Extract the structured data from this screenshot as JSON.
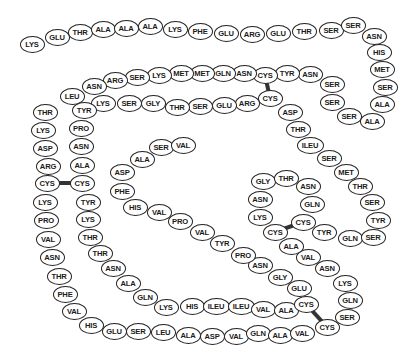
{
  "diagram": {
    "colors": {
      "outline": "#222222",
      "fill": "#ffffff",
      "text": "#1a1a1a",
      "bond": "#333333"
    },
    "residues": [
      {
        "label": "LYS",
        "x": 32,
        "y": 44
      },
      {
        "label": "GLU",
        "x": 57,
        "y": 37
      },
      {
        "label": "THR",
        "x": 80,
        "y": 32
      },
      {
        "label": "ALA",
        "x": 103,
        "y": 29
      },
      {
        "label": "ALA",
        "x": 126,
        "y": 28
      },
      {
        "label": "ALA",
        "x": 150,
        "y": 26
      },
      {
        "label": "LYS",
        "x": 175,
        "y": 29
      },
      {
        "label": "PHE",
        "x": 200,
        "y": 31
      },
      {
        "label": "GLU",
        "x": 226,
        "y": 33
      },
      {
        "label": "ARG",
        "x": 252,
        "y": 34
      },
      {
        "label": "GLU",
        "x": 278,
        "y": 33
      },
      {
        "label": "THR",
        "x": 304,
        "y": 31
      },
      {
        "label": "SER",
        "x": 331,
        "y": 30
      },
      {
        "label": "SER",
        "x": 353,
        "y": 25
      },
      {
        "label": "ASN",
        "x": 374,
        "y": 36
      },
      {
        "label": "HIS",
        "x": 379,
        "y": 52
      },
      {
        "label": "MET",
        "x": 382,
        "y": 69
      },
      {
        "label": "SER",
        "x": 385,
        "y": 87
      },
      {
        "label": "ALA",
        "x": 382,
        "y": 104
      },
      {
        "label": "ALA",
        "x": 372,
        "y": 121
      },
      {
        "label": "SER",
        "x": 349,
        "y": 116
      },
      {
        "label": "SER",
        "x": 332,
        "y": 102
      },
      {
        "label": "SER",
        "x": 332,
        "y": 84
      },
      {
        "label": "ASN",
        "x": 310,
        "y": 74
      },
      {
        "label": "TYR",
        "x": 287,
        "y": 73
      },
      {
        "label": "CYS",
        "x": 265,
        "y": 75
      },
      {
        "label": "ASN",
        "x": 244,
        "y": 73
      },
      {
        "label": "GLN",
        "x": 223,
        "y": 73
      },
      {
        "label": "MET",
        "x": 202,
        "y": 73
      },
      {
        "label": "MET",
        "x": 181,
        "y": 73
      },
      {
        "label": "LYS",
        "x": 159,
        "y": 75
      },
      {
        "label": "SER",
        "x": 137,
        "y": 77
      },
      {
        "label": "ARG",
        "x": 115,
        "y": 80
      },
      {
        "label": "ASN",
        "x": 94,
        "y": 86
      },
      {
        "label": "LEU",
        "x": 72,
        "y": 96
      },
      {
        "label": "THR",
        "x": 45,
        "y": 112
      },
      {
        "label": "LYS",
        "x": 43,
        "y": 130
      },
      {
        "label": "ASP",
        "x": 45,
        "y": 148
      },
      {
        "label": "ARG",
        "x": 48,
        "y": 166
      },
      {
        "label": "CYS",
        "x": 47,
        "y": 183
      },
      {
        "label": "LYS",
        "x": 45,
        "y": 202
      },
      {
        "label": "PRO",
        "x": 46,
        "y": 220
      },
      {
        "label": "VAL",
        "x": 48,
        "y": 239
      },
      {
        "label": "ASN",
        "x": 52,
        "y": 257
      },
      {
        "label": "THR",
        "x": 59,
        "y": 276
      },
      {
        "label": "PHE",
        "x": 65,
        "y": 294
      },
      {
        "label": "VAL",
        "x": 74,
        "y": 311
      },
      {
        "label": "HIS",
        "x": 91,
        "y": 325
      },
      {
        "label": "GLU",
        "x": 114,
        "y": 331
      },
      {
        "label": "SER",
        "x": 138,
        "y": 331
      },
      {
        "label": "LEU",
        "x": 163,
        "y": 332
      },
      {
        "label": "ALA",
        "x": 188,
        "y": 335
      },
      {
        "label": "ASP",
        "x": 212,
        "y": 336
      },
      {
        "label": "VAL",
        "x": 236,
        "y": 336
      },
      {
        "label": "GLN",
        "x": 258,
        "y": 333
      },
      {
        "label": "ALA",
        "x": 280,
        "y": 335
      },
      {
        "label": "VAL",
        "x": 302,
        "y": 333
      },
      {
        "label": "CYS",
        "x": 327,
        "y": 327
      },
      {
        "label": "SER",
        "x": 347,
        "y": 317
      },
      {
        "label": "GLN",
        "x": 350,
        "y": 300
      },
      {
        "label": "LYS",
        "x": 345,
        "y": 283
      },
      {
        "label": "ASN",
        "x": 327,
        "y": 268
      },
      {
        "label": "VAL",
        "x": 308,
        "y": 257
      },
      {
        "label": "ALA",
        "x": 291,
        "y": 246
      },
      {
        "label": "CYS",
        "x": 275,
        "y": 232
      },
      {
        "label": "LYS",
        "x": 260,
        "y": 217
      },
      {
        "label": "ASN",
        "x": 260,
        "y": 199
      },
      {
        "label": "GLY",
        "x": 263,
        "y": 181
      },
      {
        "label": "THR",
        "x": 286,
        "y": 178
      },
      {
        "label": "ASN",
        "x": 308,
        "y": 186
      },
      {
        "label": "GLN",
        "x": 312,
        "y": 204
      },
      {
        "label": "CYS",
        "x": 303,
        "y": 222
      },
      {
        "label": "TYR",
        "x": 324,
        "y": 232
      },
      {
        "label": "GLN",
        "x": 350,
        "y": 238
      },
      {
        "label": "SER",
        "x": 373,
        "y": 237
      },
      {
        "label": "TYR",
        "x": 378,
        "y": 220
      },
      {
        "label": "SER",
        "x": 372,
        "y": 202
      },
      {
        "label": "THR",
        "x": 360,
        "y": 186
      },
      {
        "label": "MET",
        "x": 346,
        "y": 172
      },
      {
        "label": "SER",
        "x": 329,
        "y": 158
      },
      {
        "label": "ILEU",
        "x": 310,
        "y": 145
      },
      {
        "label": "THR",
        "x": 298,
        "y": 129
      },
      {
        "label": "ASP",
        "x": 290,
        "y": 112
      },
      {
        "label": "CYS",
        "x": 270,
        "y": 98
      },
      {
        "label": "ARG",
        "x": 247,
        "y": 103
      },
      {
        "label": "GLU",
        "x": 224,
        "y": 105
      },
      {
        "label": "SER",
        "x": 200,
        "y": 106
      },
      {
        "label": "THR",
        "x": 177,
        "y": 107
      },
      {
        "label": "GLY",
        "x": 153,
        "y": 103
      },
      {
        "label": "SER",
        "x": 129,
        "y": 103
      },
      {
        "label": "LYS",
        "x": 103,
        "y": 103
      },
      {
        "label": "TYR",
        "x": 84,
        "y": 110
      },
      {
        "label": "PRO",
        "x": 81,
        "y": 128
      },
      {
        "label": "ASN",
        "x": 81,
        "y": 146
      },
      {
        "label": "ALA",
        "x": 82,
        "y": 165
      },
      {
        "label": "CYS",
        "x": 82,
        "y": 183
      },
      {
        "label": "TYR",
        "x": 88,
        "y": 202
      },
      {
        "label": "LYS",
        "x": 88,
        "y": 219
      },
      {
        "label": "THR",
        "x": 90,
        "y": 237
      },
      {
        "label": "THR",
        "x": 100,
        "y": 253
      },
      {
        "label": "ASN",
        "x": 113,
        "y": 268
      },
      {
        "label": "ALA",
        "x": 128,
        "y": 283
      },
      {
        "label": "GLN",
        "x": 145,
        "y": 297
      },
      {
        "label": "LYS",
        "x": 166,
        "y": 307
      },
      {
        "label": "HIS",
        "x": 192,
        "y": 306
      },
      {
        "label": "ILEU",
        "x": 216,
        "y": 306
      },
      {
        "label": "ILEU",
        "x": 241,
        "y": 306
      },
      {
        "label": "VAL",
        "x": 263,
        "y": 309
      },
      {
        "label": "ALA",
        "x": 286,
        "y": 310
      },
      {
        "label": "CYS",
        "x": 306,
        "y": 304
      },
      {
        "label": "GLU",
        "x": 299,
        "y": 288
      },
      {
        "label": "GLY",
        "x": 280,
        "y": 277
      },
      {
        "label": "ASN",
        "x": 260,
        "y": 265
      },
      {
        "label": "PRO",
        "x": 243,
        "y": 255
      },
      {
        "label": "TYR",
        "x": 222,
        "y": 243
      },
      {
        "label": "VAL",
        "x": 202,
        "y": 232
      },
      {
        "label": "PRO",
        "x": 180,
        "y": 221
      },
      {
        "label": "VAL",
        "x": 159,
        "y": 212
      },
      {
        "label": "HIS",
        "x": 135,
        "y": 207
      },
      {
        "label": "PHE",
        "x": 122,
        "y": 191
      },
      {
        "label": "ASP",
        "x": 122,
        "y": 172
      },
      {
        "label": "ALA",
        "x": 142,
        "y": 159
      },
      {
        "label": "SER",
        "x": 161,
        "y": 147
      },
      {
        "label": "VAL",
        "x": 183,
        "y": 145
      }
    ],
    "disulfide_bonds": [
      {
        "from": {
          "x": 265,
          "y": 75
        },
        "to": {
          "x": 270,
          "y": 98
        }
      },
      {
        "from": {
          "x": 47,
          "y": 183
        },
        "to": {
          "x": 82,
          "y": 183
        }
      },
      {
        "from": {
          "x": 275,
          "y": 232
        },
        "to": {
          "x": 303,
          "y": 222
        }
      },
      {
        "from": {
          "x": 306,
          "y": 304
        },
        "to": {
          "x": 327,
          "y": 327
        }
      }
    ]
  }
}
